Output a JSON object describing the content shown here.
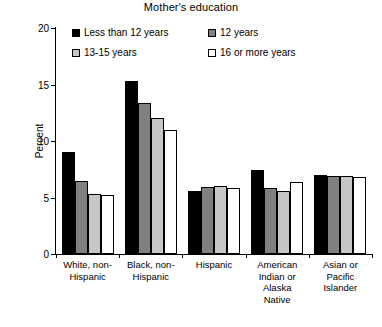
{
  "chart_data": {
    "type": "bar",
    "title": "Mother's education",
    "xlabel": "",
    "ylabel": "Percent",
    "ylim": [
      0,
      20
    ],
    "yticks": [
      0,
      5,
      10,
      15,
      20
    ],
    "grid": false,
    "legend_position": "top-inside",
    "categories": [
      "White, non-\nHispanic",
      "Black, non-\nHispanic",
      "Hispanic",
      "American\nIndian or\nAlaska\nNative",
      "Asian or\nPacific\nIslander"
    ],
    "series": [
      {
        "name": "Less than 12 years",
        "color": "#000000",
        "values": [
          9.0,
          15.3,
          5.6,
          7.4,
          7.0
        ]
      },
      {
        "name": "12 years",
        "color": "#808080",
        "values": [
          6.5,
          13.4,
          5.9,
          5.8,
          6.9
        ]
      },
      {
        "name": "13-15 years",
        "color": "#c6c6c6",
        "values": [
          5.3,
          12.0,
          6.0,
          5.6,
          6.9
        ]
      },
      {
        "name": "16 or more years",
        "color": "#ffffff",
        "values": [
          5.2,
          11.0,
          5.8,
          6.4,
          6.8
        ]
      }
    ]
  },
  "legend": {
    "items": [
      {
        "label": "Less than 12 years"
      },
      {
        "label": "12 years"
      },
      {
        "label": "13-15 years"
      },
      {
        "label": "16 or more years"
      }
    ]
  }
}
